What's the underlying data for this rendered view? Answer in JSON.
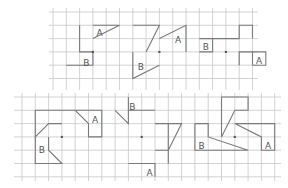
{
  "figure": {
    "panels_top": [
      {
        "name": "top-left",
        "center": [
          3,
          3
        ],
        "shapes": [
          {
            "label": "",
            "points": [
              [
                2,
                1
              ],
              [
                2,
                3
              ],
              [
                3,
                3
              ]
            ]
          },
          {
            "label": "A",
            "points": [
              [
                3,
                1
              ],
              [
                5,
                1
              ],
              [
                3,
                2
              ]
            ],
            "label_at": [
              3.5,
              1.6
            ]
          },
          {
            "label": "B",
            "points": [
              [
                1,
                4
              ],
              [
                3,
                4
              ],
              [
                3,
                3
              ]
            ],
            "label_at": [
              2.5,
              3.8
            ]
          }
        ]
      },
      {
        "name": "top-middle",
        "center": [
          8,
          3
        ],
        "shapes": [
          {
            "label": "",
            "points": [
              [
                6,
                1
              ],
              [
                8,
                1
              ],
              [
                7,
                3
              ]
            ]
          },
          {
            "label": "A",
            "points": [
              [
                8,
                2
              ],
              [
                10,
                1
              ],
              [
                10,
                3
              ]
            ],
            "label_at": [
              9.4,
              2.1
            ]
          },
          {
            "label": "B",
            "points": [
              [
                6,
                3
              ],
              [
                6,
                5
              ],
              [
                8,
                4
              ]
            ],
            "label_at": [
              6.6,
              4.1
            ]
          }
        ]
      },
      {
        "name": "top-right",
        "center": [
          13,
          3
        ],
        "shapes": [
          {
            "label": "B",
            "points": [
              [
                11,
                2
              ],
              [
                12,
                2
              ],
              [
                12,
                3
              ],
              [
                11,
                3
              ]
            ],
            "label_at": [
              11.5,
              2.65
            ]
          },
          {
            "label": "",
            "points": [
              [
                12,
                2
              ],
              [
                14,
                2
              ],
              [
                14,
                1
              ],
              [
                15,
                1
              ],
              [
                15,
                2
              ]
            ]
          },
          {
            "label": "",
            "points": [
              [
                14,
                4
              ],
              [
                14,
                3
              ],
              [
                15,
                3
              ],
              [
                15,
                4
              ]
            ]
          },
          {
            "label": "A",
            "points": [
              [
                15,
                3
              ],
              [
                16,
                3
              ],
              [
                16,
                4
              ],
              [
                15,
                4
              ]
            ],
            "label_at": [
              15.5,
              3.65
            ]
          }
        ]
      }
    ],
    "panels_bottom": [
      {
        "name": "bottom-left",
        "center": [
          3,
          3
        ],
        "shapes": [
          {
            "label": "",
            "points": [
              [
                4,
                1
              ],
              [
                1,
                1
              ],
              [
                1,
                3
              ],
              [
                2,
                2
              ],
              [
                3,
                2
              ]
            ]
          },
          {
            "label": "A",
            "points": [
              [
                4,
                1
              ],
              [
                5,
                2
              ],
              [
                5,
                3
              ],
              [
                6,
                3
              ],
              [
                6,
                1
              ],
              [
                4,
                1
              ]
            ],
            "label_at": [
              5.5,
              1.7
            ]
          },
          {
            "label": "B",
            "points": [
              [
                1,
                3
              ],
              [
                1,
                5
              ],
              [
                3,
                5
              ],
              [
                2,
                4
              ],
              [
                2,
                3
              ]
            ],
            "label_at": [
              1.5,
              4.0
            ]
          }
        ]
      },
      {
        "name": "bottom-middle",
        "center": [
          9,
          3
        ],
        "shapes": [
          {
            "label": "B",
            "points": [
              [
                8,
                0
              ],
              [
                8,
                1
              ],
              [
                10,
                1
              ]
            ],
            "label_at": [
              8.3,
              0.75
            ]
          },
          {
            "label": "",
            "points": [
              [
                7,
                1
              ],
              [
                8,
                2
              ],
              [
                8,
                1
              ]
            ]
          },
          {
            "label": "",
            "points": [
              [
                10,
                2
              ],
              [
                11,
                2
              ],
              [
                12,
                2
              ],
              [
                11,
                4
              ],
              [
                11,
                2
              ]
            ]
          },
          {
            "label": "",
            "points": [
              [
                10,
                4
              ],
              [
                11,
                4
              ],
              [
                11,
                5
              ]
            ]
          },
          {
            "label": "A",
            "points": [
              [
                8,
                5
              ],
              [
                10,
                5
              ],
              [
                10,
                6
              ]
            ],
            "label_at": [
              9.6,
              5.75
            ]
          }
        ]
      },
      {
        "name": "bottom-right",
        "center": [
          16,
          3
        ],
        "shapes": [
          {
            "label": "B",
            "points": [
              [
                13,
                2
              ],
              [
                14,
                2
              ],
              [
                14,
                3
              ],
              [
                17,
                4
              ],
              [
                13,
                4
              ],
              [
                13,
                2
              ]
            ],
            "label_at": [
              13.5,
              3.7
            ]
          },
          {
            "label": "",
            "points": [
              [
                15,
                3
              ],
              [
                16,
                1
              ],
              [
                17,
                1
              ],
              [
                17,
                0
              ],
              [
                15,
                0
              ],
              [
                15,
                3
              ]
            ]
          },
          {
            "label": "A",
            "points": [
              [
                16,
                2
              ],
              [
                19,
                2
              ],
              [
                19,
                4
              ],
              [
                18,
                4
              ],
              [
                18,
                3
              ],
              [
                16,
                2
              ]
            ],
            "label_at": [
              18.5,
              3.7
            ]
          }
        ]
      }
    ],
    "colors": {
      "grid": "#c8c8c8",
      "shape": "#7a7a7a",
      "text": "#555555"
    }
  }
}
